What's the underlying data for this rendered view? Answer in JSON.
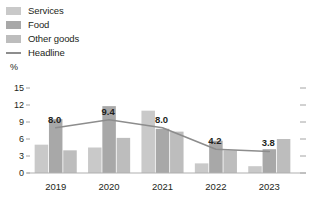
{
  "legend": {
    "items": [
      {
        "label": "Services",
        "icon": "square-swatch-icon",
        "color": "#c9c9c9",
        "type": "bar"
      },
      {
        "label": "Food",
        "icon": "square-swatch-icon",
        "color": "#a8a8a8",
        "type": "bar"
      },
      {
        "label": "Other goods",
        "icon": "square-swatch-icon",
        "color": "#bdbdbd",
        "type": "bar"
      },
      {
        "label": "Headline",
        "icon": "line-swatch-icon",
        "color": "#8d8d8d",
        "type": "line"
      }
    ]
  },
  "axis": {
    "unit": "%",
    "y_ticks": [
      "0",
      "3",
      "6",
      "9",
      "12",
      "15"
    ],
    "x_ticks": [
      "2019",
      "2020",
      "2021",
      "2022",
      "2023"
    ]
  },
  "chart_data": {
    "type": "bar",
    "title": "",
    "subtitle": "",
    "xlabel": "",
    "ylabel": "%",
    "ylim": [
      0,
      15
    ],
    "yticks": [
      0,
      3,
      6,
      9,
      12,
      15
    ],
    "grid": false,
    "legend_position": "top-left",
    "categories": [
      "2019",
      "2020",
      "2021",
      "2022",
      "2023"
    ],
    "series": [
      {
        "name": "Services",
        "type": "bar",
        "color": "#c9c9c9",
        "values": [
          5.0,
          4.5,
          11.0,
          1.7,
          1.2
        ]
      },
      {
        "name": "Food",
        "type": "bar",
        "color": "#a8a8a8",
        "values": [
          9.5,
          11.8,
          7.8,
          5.7,
          4.2
        ]
      },
      {
        "name": "Other goods",
        "type": "bar",
        "color": "#bdbdbd",
        "values": [
          4.0,
          6.2,
          7.3,
          4.0,
          6.0
        ]
      },
      {
        "name": "Headline",
        "type": "line",
        "color": "#8d8d8d",
        "values": [
          8.0,
          9.4,
          8.0,
          4.2,
          3.8
        ]
      }
    ],
    "data_labels": [
      "8.0",
      "9.4",
      "8.0",
      "4.2",
      "3.8"
    ]
  }
}
